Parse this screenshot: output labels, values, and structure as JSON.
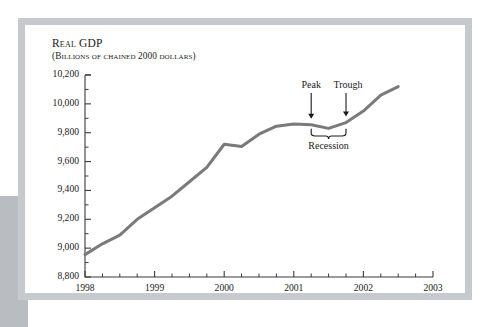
{
  "figure": {
    "background_color": "#ffffff",
    "frame_color": "#c6c9cd",
    "left_block_color": "#b9bcc0",
    "line_color": "#7a7a7a",
    "axis_color": "#3a3a3a",
    "text_color": "#1a1a1a"
  },
  "annotations": {
    "peak_label": "Peak",
    "trough_label": "Trough",
    "recession_label": "Recession"
  },
  "chart_data": {
    "type": "line",
    "title": "Real GDP",
    "subtitle": "(Billions of chained 2000 dollars)",
    "xlabel": "",
    "ylabel": "",
    "grid": false,
    "legend": "none",
    "xlim": [
      1998.0,
      2003.0
    ],
    "ylim": [
      8800,
      10200
    ],
    "ytick_labels": [
      "8,800",
      "9,000",
      "9,200",
      "9,400",
      "9,600",
      "9,800",
      "10,000",
      "10,200"
    ],
    "yticks": [
      8800,
      9000,
      9200,
      9400,
      9600,
      9800,
      10000,
      10200
    ],
    "yminor_step": 100,
    "xtick_labels": [
      "1998",
      "1999",
      "2000",
      "2001",
      "2002",
      "2003"
    ],
    "xticks": [
      1998,
      1999,
      2000,
      2001,
      2002,
      2003
    ],
    "xminor_step": 0.25,
    "x": [
      1998.0,
      1998.25,
      1998.5,
      1998.75,
      1999.0,
      1999.25,
      1999.5,
      1999.75,
      2000.0,
      2000.25,
      2000.5,
      2000.75,
      2001.0,
      2001.25,
      2001.5,
      2001.75,
      2002.0,
      2002.25,
      2002.5
    ],
    "values": [
      8955,
      9030,
      9090,
      9200,
      9280,
      9360,
      9460,
      9560,
      9720,
      9705,
      9790,
      9845,
      9860,
      9855,
      9830,
      9870,
      9950,
      10060,
      10120
    ],
    "series": [
      {
        "name": "Real GDP",
        "values": [
          8955,
          9030,
          9090,
          9200,
          9280,
          9360,
          9460,
          9560,
          9720,
          9705,
          9790,
          9845,
          9860,
          9855,
          9830,
          9870,
          9950,
          10060,
          10120
        ]
      }
    ],
    "markers": {
      "peak": {
        "x": 2001.25,
        "y": 9855,
        "label": "Peak"
      },
      "trough": {
        "x": 2001.75,
        "y": 9870,
        "label": "Trough"
      },
      "recession_span": {
        "from": 2001.25,
        "to": 2001.75,
        "label": "Recession"
      }
    }
  }
}
